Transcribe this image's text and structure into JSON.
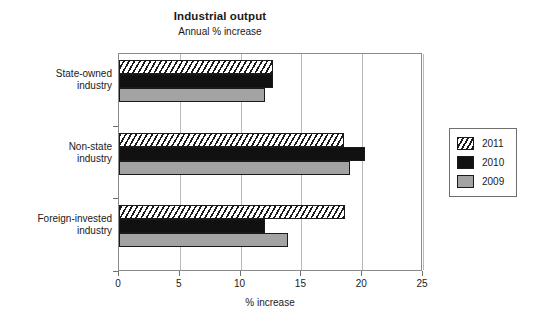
{
  "chart_data": {
    "type": "bar",
    "orientation": "horizontal",
    "title": "Industrial output",
    "subtitle": "Annual % increase",
    "xlabel": "% increase",
    "ylabel": "",
    "xlim": [
      0,
      25
    ],
    "xticks": [
      "0",
      "5",
      "10",
      "15",
      "20",
      "25"
    ],
    "grid": true,
    "legend_position": "right",
    "categories": [
      "State-owned industry",
      "Non-state industry",
      "Foreign-invested industry"
    ],
    "category_lines": [
      [
        "State-owned",
        "industry"
      ],
      [
        "Non-state",
        "industry"
      ],
      [
        "Foreign-invested",
        "industry"
      ]
    ],
    "series": [
      {
        "name": "2011",
        "style": "hatched",
        "color": "#ffffff",
        "values": [
          12.7,
          18.5,
          18.6
        ]
      },
      {
        "name": "2010",
        "style": "solid",
        "color": "#111111",
        "values": [
          12.7,
          20.2,
          12.0
        ]
      },
      {
        "name": "2009",
        "style": "solid",
        "color": "#a3a3a3",
        "values": [
          12.0,
          19.0,
          13.9
        ]
      }
    ]
  },
  "legend": {
    "entries": [
      {
        "label": "2011"
      },
      {
        "label": "2010"
      },
      {
        "label": "2009"
      }
    ]
  }
}
